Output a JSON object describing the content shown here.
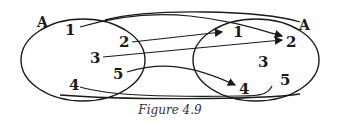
{
  "figure": {
    "caption": "Figure 4.9",
    "left_set": {
      "label": "A",
      "elements": [
        "1",
        "2",
        "3",
        "4",
        "5"
      ]
    },
    "right_set": {
      "label": "A",
      "elements": [
        "1",
        "2",
        "3",
        "4",
        "5"
      ]
    },
    "mapping": [
      {
        "from": "1",
        "to": "2"
      },
      {
        "from": "2",
        "to": "1"
      },
      {
        "from": "3",
        "to": "2"
      },
      {
        "from": "4",
        "to": "5"
      },
      {
        "from": "5",
        "to": "4"
      }
    ],
    "colors": {
      "ink": "#1a1a1a",
      "background": "#ffffff"
    }
  }
}
